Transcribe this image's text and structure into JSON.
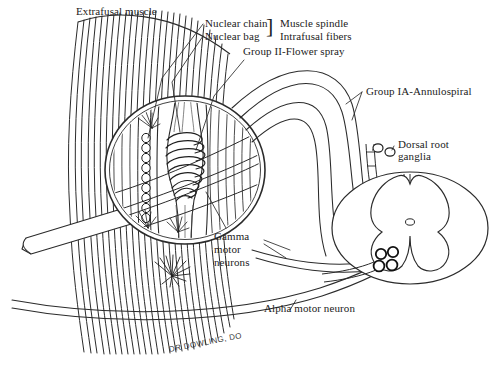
{
  "figure": {
    "background_color": "#ffffff",
    "ink_color": "#222222",
    "width": 493,
    "height": 366
  },
  "labels": {
    "extrafusal_muscle": "Extrafusal muscle",
    "nuclear_chain": "Nuclear chain",
    "nuclear_bag": "Nuclear bag",
    "bracket": "]",
    "muscle_spindle": "Muscle spindle",
    "intrafusal_fibers": "Intrafusal fibers",
    "group_ii_flower_spray": "Group II-Flower spray",
    "group_ia_annulospiral": "Group IA-Annulospiral",
    "dorsal_root_line1": "Dorsal root",
    "dorsal_root_line2": "ganglia",
    "gamma_line1": "Gamma",
    "gamma_line2": "motor",
    "gamma_line3": "neurons",
    "alpha_motor_neuron": "Alpha motor neuron",
    "signature": "DR DOWLING, DO"
  },
  "structures": {
    "extrafusal_fiber_count": 26,
    "magnifier_circle": {
      "cx": 185,
      "cy": 170,
      "rx": 80,
      "ry": 74
    },
    "nuclear_bag_coils": 9,
    "nuclear_chain_nuclei": 11,
    "dorsal_root_ganglion_cells": 2,
    "alpha_motor_neuron_somas": 4,
    "spinal_cord": {
      "cx": 410,
      "cy": 228,
      "rx": 78,
      "ry": 56
    },
    "motor_end_plate_rays": 10
  }
}
